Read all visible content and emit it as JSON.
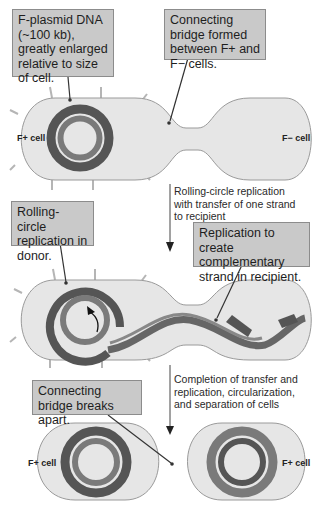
{
  "stage1": {
    "callouts": [
      {
        "text": "F-plasmid DNA (~100 kb), greatly enlarged relative to size of cell."
      },
      {
        "text": "Connecting bridge formed between F+ and F− cells."
      }
    ],
    "cells": {
      "left": "F+ cell",
      "right": "F− cell"
    }
  },
  "step1_note": "Rolling-circle replication with transfer of one strand to recipient",
  "stage2": {
    "callouts": [
      {
        "text": "Rolling-circle replication in donor."
      },
      {
        "text": "Replication to create complementary strand in recipient."
      }
    ]
  },
  "step2_note": "Completion of transfer and replication, circularization, and separation of cells",
  "stage3": {
    "callouts": [
      {
        "text": "Connecting bridge breaks apart."
      }
    ],
    "cells": {
      "left": "F+ cell",
      "right": "F+ cell"
    }
  },
  "colors": {
    "cell_fill": "#e6e6e6",
    "cell_stroke": "#9a9a9a",
    "dna_dark": "#555555",
    "dna_mid": "#7a7a7a",
    "callout_fill": "#c9c9c9"
  }
}
